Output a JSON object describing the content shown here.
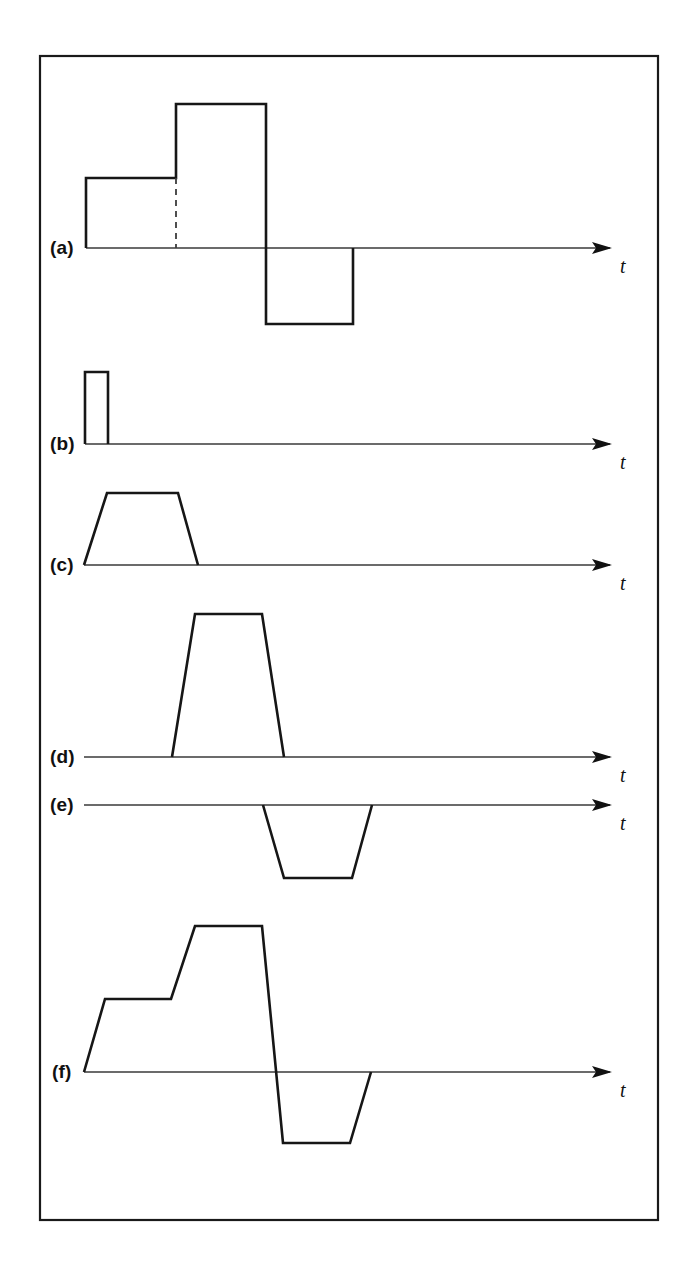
{
  "figure": {
    "background_color": "#ffffff",
    "frame": {
      "name": "figure-border",
      "x": 40,
      "y": 56,
      "width": 618,
      "height": 1164,
      "stroke_color": "#1a1a1a"
    },
    "stroke_color": "#161616",
    "axis_color": "#3a3a3a",
    "axis_arrow_label": "t",
    "panels": [
      {
        "id": "a",
        "label": "(a)",
        "label_x": 50,
        "label_y": 254,
        "baseline_y": 248,
        "axis_x_start": 86,
        "axis_x_end": 612,
        "axis_label": "t",
        "axis_label_x": 620,
        "axis_label_y": 273,
        "description": "two-level positive staircase pulse followed by a negative rectangular pulse",
        "wave_points": "86,248 86,178 176,178 176,104 266,104 266,324 353,324 353,248",
        "dashed_segment": "176,178 176,248",
        "levels": {
          "level_1_amplitude": 70,
          "level_2_amplitude": 144,
          "negative_amplitude": -76
        }
      },
      {
        "id": "b",
        "label": "(b)",
        "label_x": 50,
        "label_y": 450,
        "baseline_y": 444,
        "axis_x_start": 85,
        "axis_x_end": 612,
        "axis_label": "t",
        "axis_label_x": 620,
        "axis_label_y": 469,
        "description": "single narrow positive rectangular pulse at the origin",
        "wave_points": "85,444 85,372 108,372 108,444",
        "levels": {
          "pulse_amplitude": 72,
          "pulse_width": 23
        }
      },
      {
        "id": "c",
        "label": "(c)",
        "label_x": 50,
        "label_y": 571,
        "baseline_y": 565,
        "axis_x_start": 84,
        "axis_x_end": 612,
        "axis_label": "t",
        "axis_label_x": 620,
        "axis_label_y": 590,
        "description": "positive trapezoidal pulse starting at the origin",
        "wave_points": "84,565 107,493 178,493 198,565",
        "levels": {
          "pulse_amplitude": 72
        }
      },
      {
        "id": "d",
        "label": "(d)",
        "label_x": 50,
        "label_y": 763,
        "baseline_y": 757,
        "axis_x_start": 84,
        "axis_x_end": 612,
        "axis_label": "t",
        "axis_label_x": 620,
        "axis_label_y": 782,
        "description": "delayed tall positive trapezoidal pulse",
        "wave_points": "172,757 195,614 262,614 284,757",
        "levels": {
          "pulse_amplitude": 143
        }
      },
      {
        "id": "e",
        "label": "(e)",
        "label_x": 50,
        "label_y": 811,
        "baseline_y": 805,
        "axis_x_start": 84,
        "axis_x_end": 612,
        "axis_label": "t",
        "axis_label_x": 620,
        "axis_label_y": 830,
        "description": "delayed negative trapezoidal pulse below the time axis",
        "wave_points": "263,805 284,878 352,878 372,805",
        "levels": {
          "pulse_amplitude": -73
        }
      },
      {
        "id": "f",
        "label": "(f)",
        "label_x": 52,
        "label_y": 1078,
        "baseline_y": 1072,
        "axis_x_start": 84,
        "axis_x_end": 612,
        "axis_label": "t",
        "axis_label_x": 620,
        "axis_label_y": 1097,
        "description": "composite waveform: two-level positive ramped staircase followed by a negative trapezoidal pulse",
        "wave_points": "84,1072 105,999 171,999 195,926 262,926 283,1143 350,1143 371,1072",
        "levels": {
          "level_1_amplitude": 73,
          "level_2_amplitude": 146,
          "negative_amplitude": -71
        }
      }
    ]
  }
}
